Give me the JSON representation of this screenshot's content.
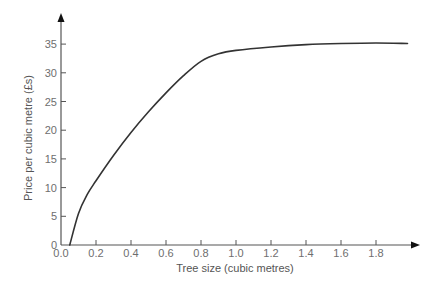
{
  "chart_data": {
    "type": "line",
    "title": "",
    "xlabel": "Tree size (cubic metres)",
    "ylabel": "Price per cubic metre (£s)",
    "xlim": [
      0.0,
      2.0
    ],
    "ylim": [
      0,
      38
    ],
    "grid": false,
    "legend": null,
    "x_ticks": [
      0.0,
      0.2,
      0.4,
      0.6,
      0.8,
      1.0,
      1.2,
      1.4,
      1.6,
      1.8
    ],
    "x_tick_labels": [
      "0.0",
      "0.2",
      "0.4",
      "0.6",
      "0.8",
      "1.0",
      "1.2",
      "1.4",
      "1.6",
      "1.8"
    ],
    "y_ticks": [
      0,
      5,
      10,
      15,
      20,
      25,
      30,
      35
    ],
    "y_tick_labels": [
      "0",
      "5",
      "10",
      "15",
      "20",
      "25",
      "30",
      "35"
    ],
    "series": [
      {
        "name": "Price per cubic metre",
        "color": "#333333",
        "x": [
          0.05,
          0.1,
          0.15,
          0.2,
          0.3,
          0.4,
          0.5,
          0.6,
          0.7,
          0.8,
          0.9,
          1.0,
          1.2,
          1.4,
          1.6,
          1.8,
          1.98
        ],
        "y": [
          0,
          5.5,
          8.8,
          11.2,
          15.6,
          19.6,
          23.2,
          26.5,
          29.5,
          32.0,
          33.3,
          33.9,
          34.5,
          34.9,
          35.1,
          35.2,
          35.1
        ]
      }
    ]
  },
  "axes": {
    "x_title": "Tree size (cubic metres)",
    "y_title": "Price per cubic metre (£s)",
    "axis_color": "#555555",
    "line_color": "#333333",
    "text_color": "#6e6e6e"
  }
}
